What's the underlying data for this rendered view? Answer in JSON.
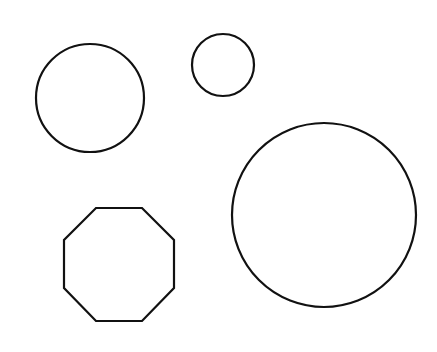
{
  "canvas": {
    "width": 437,
    "height": 352,
    "background": "#ffffff"
  },
  "style": {
    "stroke": "#111111",
    "stroke_width": 2.2,
    "fill": "none"
  },
  "shapes": [
    {
      "type": "circle",
      "name": "medium-circle",
      "cx": 90,
      "cy": 98,
      "r": 54
    },
    {
      "type": "circle",
      "name": "small-circle",
      "cx": 223,
      "cy": 65,
      "r": 31
    },
    {
      "type": "circle",
      "name": "large-circle",
      "cx": 324,
      "cy": 215,
      "r": 92
    },
    {
      "type": "polygon",
      "name": "octagon",
      "points": "96,208 142,208 174,240 174,288 142,321 96,321 64,288 64,240"
    }
  ]
}
